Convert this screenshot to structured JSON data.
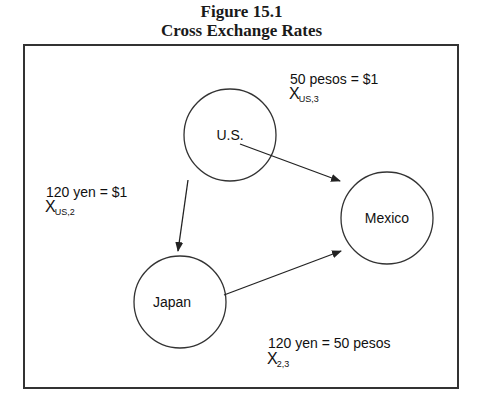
{
  "figure": {
    "number": "Figure 15.1",
    "title": "Cross Exchange Rates"
  },
  "nodes": {
    "us": "U.S.",
    "mexico": "Mexico",
    "japan": "Japan"
  },
  "edges": [
    {
      "from": "U.S.",
      "to": "Mexico",
      "rate": "50 pesos = $1",
      "symbol": "X",
      "subscript": "US,3"
    },
    {
      "from": "U.S.",
      "to": "Japan",
      "rate": "120 yen = $1",
      "symbol": "X",
      "subscript": "US,2"
    },
    {
      "from": "Japan",
      "to": "Mexico",
      "rate": "120 yen = 50 pesos",
      "symbol": "X",
      "subscript": "2,3"
    }
  ]
}
